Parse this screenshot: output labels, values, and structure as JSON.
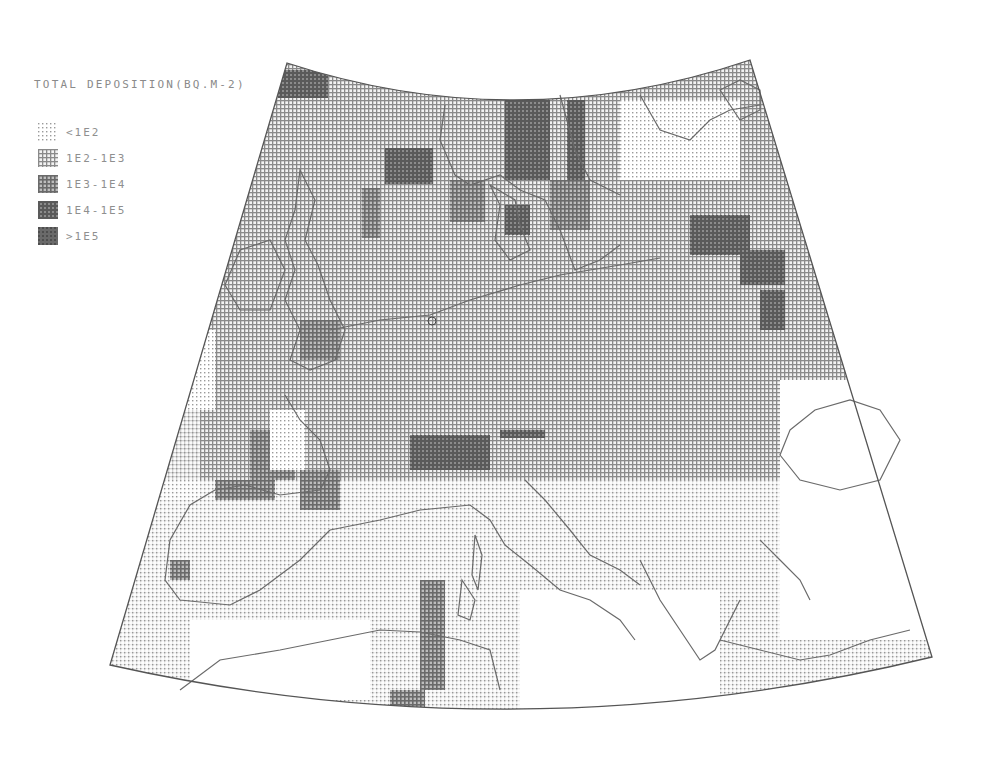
{
  "legend": {
    "title": "TOTAL DEPOSITION(BQ.M-2)",
    "items": [
      {
        "label": "<1E2",
        "level": 0
      },
      {
        "label": "1E2-1E3",
        "level": 1
      },
      {
        "label": "1E3-1E4",
        "level": 2
      },
      {
        "label": "1E4-1E5",
        "level": 3
      },
      {
        "label": ">1E5",
        "level": 4
      }
    ]
  },
  "colors": {
    "level0": "#e4e4e4",
    "level1": "#b9b9b9",
    "level2": "#8f8f8f",
    "level3": "#6f6f6f",
    "level4": "#616161",
    "outline": "#555555",
    "background": "#ffffff"
  },
  "map": {
    "frame": {
      "top_left": [
        287,
        63
      ],
      "top_right": [
        750,
        60
      ],
      "top_mid_y": 100,
      "bottom_left": [
        110,
        665
      ],
      "bottom_right": [
        932,
        657
      ],
      "bottom_mid_y": 709
    },
    "cells": [
      {
        "x": 278,
        "y": 70,
        "w": 50,
        "h": 28,
        "level": 3
      },
      {
        "x": 385,
        "y": 148,
        "w": 48,
        "h": 36,
        "level": 3
      },
      {
        "x": 505,
        "y": 100,
        "w": 45,
        "h": 80,
        "level": 3
      },
      {
        "x": 567,
        "y": 100,
        "w": 18,
        "h": 90,
        "level": 3
      },
      {
        "x": 450,
        "y": 180,
        "w": 35,
        "h": 42,
        "level": 2
      },
      {
        "x": 505,
        "y": 205,
        "w": 25,
        "h": 30,
        "level": 3
      },
      {
        "x": 550,
        "y": 180,
        "w": 40,
        "h": 50,
        "level": 2
      },
      {
        "x": 362,
        "y": 188,
        "w": 18,
        "h": 50,
        "level": 2
      },
      {
        "x": 690,
        "y": 215,
        "w": 60,
        "h": 40,
        "level": 3
      },
      {
        "x": 740,
        "y": 250,
        "w": 45,
        "h": 35,
        "level": 3
      },
      {
        "x": 760,
        "y": 290,
        "w": 25,
        "h": 40,
        "level": 3
      },
      {
        "x": 300,
        "y": 320,
        "w": 40,
        "h": 40,
        "level": 2
      },
      {
        "x": 410,
        "y": 435,
        "w": 80,
        "h": 35,
        "level": 3
      },
      {
        "x": 500,
        "y": 420,
        "w": 45,
        "h": 18,
        "level": 3
      },
      {
        "x": 545,
        "y": 403,
        "w": 20,
        "h": 16,
        "level": 3
      },
      {
        "x": 250,
        "y": 430,
        "w": 45,
        "h": 50,
        "level": 2
      },
      {
        "x": 300,
        "y": 470,
        "w": 40,
        "h": 40,
        "level": 2
      },
      {
        "x": 215,
        "y": 480,
        "w": 60,
        "h": 20,
        "level": 2
      },
      {
        "x": 170,
        "y": 560,
        "w": 20,
        "h": 20,
        "level": 2
      },
      {
        "x": 420,
        "y": 580,
        "w": 25,
        "h": 110,
        "level": 2
      },
      {
        "x": 390,
        "y": 690,
        "w": 35,
        "h": 18,
        "level": 2
      },
      {
        "x": 520,
        "y": 250,
        "w": 120,
        "h": 120,
        "level": 1
      },
      {
        "x": 330,
        "y": 380,
        "w": 380,
        "h": 50,
        "level": 1
      },
      {
        "x": 620,
        "y": 100,
        "w": 120,
        "h": 80,
        "level": 0
      },
      {
        "x": 780,
        "y": 380,
        "w": 150,
        "h": 260,
        "level": -1
      },
      {
        "x": 520,
        "y": 590,
        "w": 200,
        "h": 120,
        "level": -1
      },
      {
        "x": 190,
        "y": 620,
        "w": 180,
        "h": 80,
        "level": -1
      },
      {
        "x": 145,
        "y": 330,
        "w": 70,
        "h": 80,
        "level": 0
      },
      {
        "x": 270,
        "y": 410,
        "w": 35,
        "h": 60,
        "level": 0
      }
    ]
  }
}
